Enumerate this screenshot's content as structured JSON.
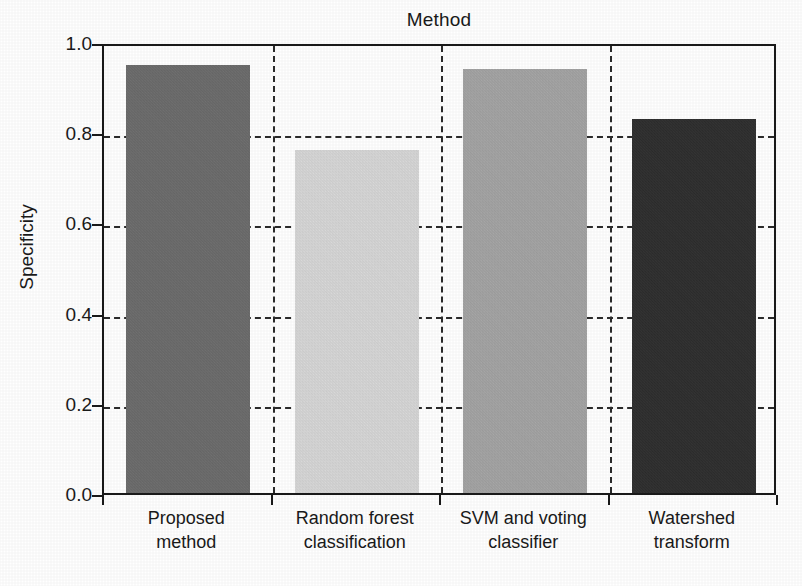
{
  "chart_data": {
    "type": "bar",
    "title": "Method",
    "xlabel": "",
    "ylabel": "Specificity",
    "categories": [
      "Proposed method",
      "Random forest classification",
      "SVM and voting classifier",
      "Watershed transform"
    ],
    "category_lines": [
      [
        "Proposed",
        "method"
      ],
      [
        "Random forest",
        "classification"
      ],
      [
        "SVM and voting",
        "classifier"
      ],
      [
        "Watershed",
        "transform"
      ]
    ],
    "values": [
      0.95,
      0.76,
      0.94,
      0.83
    ],
    "ylim": [
      0.0,
      1.0
    ],
    "yticks": [
      "0.0",
      "0.2",
      "0.4",
      "0.6",
      "0.8",
      "1.0"
    ],
    "ytick_values": [
      0.0,
      0.2,
      0.4,
      0.6,
      0.8,
      1.0
    ],
    "grid": "dashed horizontal gridlines at y ticks and dashed vertical separators between categories",
    "legend": "none",
    "bar_colors": [
      "#6b6b6b",
      "#e2e2e2",
      "#a9a9a9",
      "#262626"
    ],
    "axis_color": "#1a1a1a",
    "grid_color": "#2b2b2b",
    "background": "#ffffff"
  }
}
